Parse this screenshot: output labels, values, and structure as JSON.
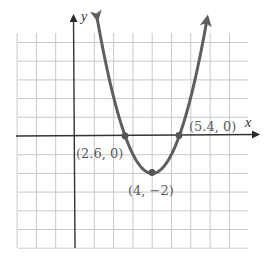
{
  "chart_data": {
    "type": "line",
    "title": "",
    "xlabel": "x",
    "ylabel": "y",
    "function": "y = (x - 2.6)(x - 5.4) ≈ (x - 4)^2 - 2",
    "grid": true,
    "xlim": [
      -3,
      8.5
    ],
    "ylim": [
      -5.8,
      6.5
    ],
    "grid_step": 1,
    "series": [
      {
        "name": "parabola",
        "color": "#5a5a5a",
        "arrows": "both-ends"
      }
    ],
    "points": [
      {
        "x": 2.6,
        "y": 0,
        "label": "(2.6, 0)"
      },
      {
        "x": 5.4,
        "y": 0,
        "label": "(5.4, 0)"
      },
      {
        "x": 4,
        "y": -2,
        "label": "(4, −2)"
      }
    ]
  },
  "labels": {
    "x_axis": "x",
    "y_axis": "y",
    "left_intercept": "(2.6, 0)",
    "right_intercept": "(5.4, 0)",
    "vertex": "(4, −2)"
  },
  "colors": {
    "grid": "#c8c8c8",
    "axis": "#3a3a3a",
    "curve": "#5e5e5e",
    "text": "#5a5a5a"
  }
}
